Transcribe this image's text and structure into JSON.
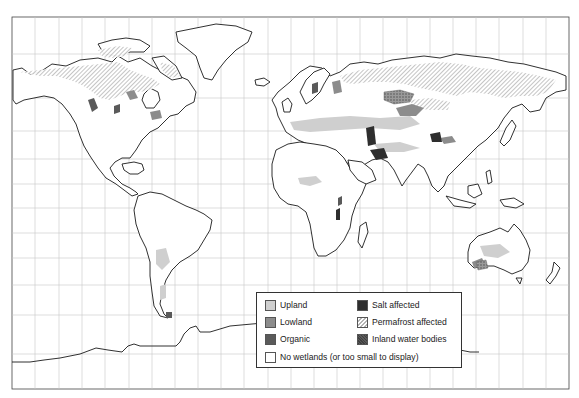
{
  "map": {
    "type": "world-wetlands-distribution",
    "frame": {
      "x": 12,
      "y": 17,
      "width": 557,
      "height": 372
    },
    "grid": {
      "vertical_x": [
        35,
        59,
        82,
        105,
        129,
        152,
        175,
        198,
        221,
        244,
        268,
        291,
        314,
        337,
        360,
        383,
        407,
        430,
        453,
        476,
        499,
        523,
        546
      ],
      "horizontal_y": [
        54,
        98,
        131,
        159,
        184,
        208,
        233,
        258,
        285,
        315,
        354
      ]
    },
    "colors": {
      "upland": "#cfcfcf",
      "lowland": "#8c8c8c",
      "organic": "#5a5a5a",
      "salt_affected": "#2e2e2e",
      "permafrost": "#b4b4b4",
      "inland_water": "#888888",
      "coastline": "#1a1a1a",
      "grid": "#c8c8c8"
    }
  },
  "legend": {
    "items": [
      {
        "key": "upland",
        "label": "Upland"
      },
      {
        "key": "lowland",
        "label": "Lowland"
      },
      {
        "key": "organic",
        "label": "Organic"
      },
      {
        "key": "salt",
        "label": "Salt affected"
      },
      {
        "key": "permafrost",
        "label": "Permafrost affected"
      },
      {
        "key": "water",
        "label": "Inland water bodies"
      },
      {
        "key": "none",
        "label": "No wetlands (or too small to display)"
      }
    ]
  }
}
